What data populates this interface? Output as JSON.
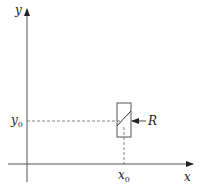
{
  "diagram": {
    "axes": {
      "x_label": "x",
      "y_label": "y"
    },
    "point": {
      "x_label": "x",
      "x_sub": "0",
      "y_label": "y",
      "y_sub": "0"
    },
    "region": {
      "label": "R"
    },
    "colors": {
      "axis": "#555555",
      "dashed": "#666666",
      "text": "#222222"
    }
  }
}
